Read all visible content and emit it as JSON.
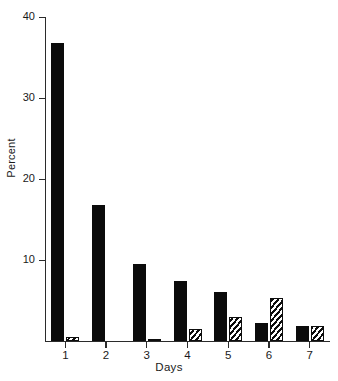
{
  "chart_data": {
    "type": "bar",
    "title": "",
    "subtitle": "",
    "xlabel": "Days",
    "ylabel": "Percent",
    "categories": [
      "1",
      "2",
      "3",
      "4",
      "5",
      "6",
      "7"
    ],
    "ylim": [
      0,
      40
    ],
    "yticks": [
      10,
      20,
      30,
      40
    ],
    "ytick_labels": [
      "10",
      "20",
      "30",
      "40"
    ],
    "xlim": [
      0.5,
      7.5
    ],
    "grid": false,
    "legend": "none",
    "series": [
      {
        "name": "solid",
        "fill": "solid-black",
        "values": [
          36.8,
          16.8,
          9.5,
          7.4,
          6.0,
          2.2,
          1.9
        ]
      },
      {
        "name": "hatched",
        "fill": "diagonal-hatch",
        "values": [
          0.5,
          0.0,
          0.3,
          1.5,
          3.0,
          5.3,
          1.9
        ]
      }
    ],
    "annotations": []
  },
  "colors": {
    "background": "#ffffff",
    "axis": "#2b2b2b",
    "solid_bar": "#0b0b0b",
    "hatch_line": "#0d0d0d",
    "text": "#1a1a1a"
  }
}
